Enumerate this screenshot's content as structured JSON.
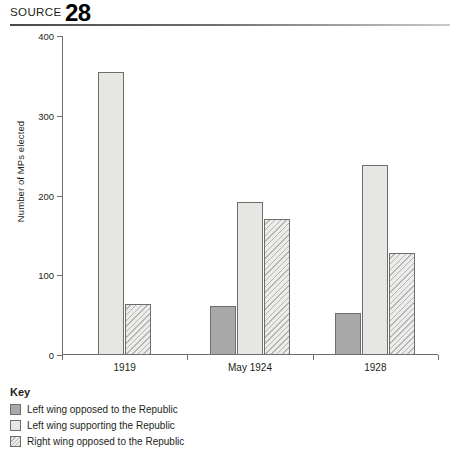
{
  "header": {
    "source_label": "SOURCE",
    "source_number": "28"
  },
  "legend": {
    "title": "Key",
    "items": [
      {
        "label": "Left wing opposed to the Republic",
        "style": "dark"
      },
      {
        "label": "Left wing supporting the Republic",
        "style": "light"
      },
      {
        "label": "Right wing opposed to the Republic",
        "style": "hatch"
      }
    ]
  },
  "chart_data": {
    "type": "bar",
    "title": "",
    "xlabel": "",
    "ylabel": "Number of MPs elected",
    "categories": [
      "1919",
      "May 1924",
      "1928"
    ],
    "ylim": [
      0,
      400
    ],
    "yticks": [
      0,
      100,
      200,
      300,
      400
    ],
    "ytick_labels": [
      "0",
      "100",
      "200",
      "300",
      "400"
    ],
    "grid": false,
    "legend_position": "below-plot-left",
    "series": [
      {
        "name": "Left wing opposed to the Republic",
        "style": "dark",
        "color": "#a9a9a9",
        "values": [
          null,
          62,
          53
        ]
      },
      {
        "name": "Left wing supporting the Republic",
        "style": "light",
        "color": "#e6e6e3",
        "values": [
          355,
          192,
          238
        ]
      },
      {
        "name": "Right wing opposed to the Republic",
        "style": "hatch",
        "color": "#ececea",
        "values": [
          64,
          170,
          128
        ]
      }
    ]
  }
}
